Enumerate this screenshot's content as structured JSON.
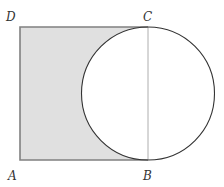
{
  "diagram": {
    "type": "geometry",
    "labels": {
      "A": "A",
      "B": "B",
      "C": "C",
      "D": "D"
    },
    "points": {
      "A": [
        20,
        160
      ],
      "B": [
        148,
        160
      ],
      "C": [
        148,
        27
      ],
      "D": [
        20,
        27
      ]
    },
    "circle": {
      "cx": 148,
      "cy": 93.5,
      "r": 66.5
    },
    "colors": {
      "shade": "#e0e0e0",
      "square_stroke": "#808080",
      "circle_stroke": "#333333",
      "diameter_stroke": "#999999",
      "background": "#ffffff"
    }
  }
}
